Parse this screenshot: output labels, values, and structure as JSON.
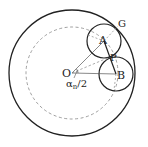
{
  "diagram": {
    "type": "geometry",
    "labels": {
      "O": "O",
      "A": "A",
      "B": "B",
      "P": "P",
      "G": "G",
      "angle": "α",
      "angle_sub": "n",
      "angle_tail": "/2"
    },
    "points": {
      "O": [
        70,
        73
      ],
      "A": [
        104,
        41
      ],
      "B": [
        116,
        74
      ],
      "P": [
        110,
        57
      ],
      "G": [
        117,
        28
      ]
    },
    "circles": {
      "outer": {
        "cx": 72,
        "cy": 73,
        "r": 63,
        "style": "solid"
      },
      "dashed": {
        "cx": 72,
        "cy": 73,
        "r": 46,
        "style": "dashed"
      },
      "A": {
        "cx": 104,
        "cy": 41,
        "r": 17,
        "style": "solid"
      },
      "B": {
        "cx": 116,
        "cy": 74,
        "r": 17,
        "style": "solid"
      }
    },
    "colors": {
      "stroke": "#222222",
      "thin": "#555555",
      "dashed": "#888888"
    }
  }
}
